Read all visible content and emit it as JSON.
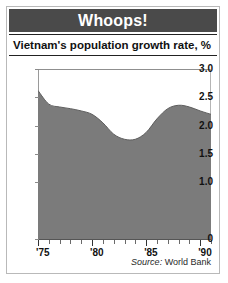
{
  "banner": {
    "title": "Whoops!"
  },
  "subtitle": "Vietnam's population growth rate, %",
  "source": {
    "lead": "Source:",
    "text": " World Bank"
  },
  "colors": {
    "banner_bg": "#4a4a4a",
    "banner_text": "#ffffff",
    "area_fill": "#7b7b7b",
    "area_line": "#5e5e5e",
    "axis": "#555555",
    "frame": "#b9b9b9"
  },
  "chart_data": {
    "type": "area",
    "title": "Whoops!",
    "subtitle": "Vietnam's population growth rate, %",
    "xlabel": "",
    "ylabel": "%",
    "xlim": [
      1975,
      1991
    ],
    "ylim": [
      0,
      3.0
    ],
    "grid": false,
    "legend": "none",
    "source": "Source: World Bank",
    "ytick_labels": [
      "3.0",
      "2.5",
      "2.0",
      "1.5",
      "1.0",
      "0"
    ],
    "ytick_values": [
      3.0,
      2.5,
      2.0,
      1.5,
      1.0,
      0
    ],
    "xtick_labels": [
      "'75",
      "'80",
      "'85",
      "'90"
    ],
    "xtick_values": [
      1975,
      1980,
      1985,
      1990
    ],
    "xtick_minor_step": 1,
    "x": [
      1975,
      1976,
      1977,
      1978,
      1979,
      1980,
      1981,
      1982,
      1983,
      1984,
      1985,
      1986,
      1987,
      1988,
      1989,
      1990,
      1991
    ],
    "values": [
      2.62,
      2.38,
      2.33,
      2.3,
      2.26,
      2.2,
      2.05,
      1.85,
      1.76,
      1.76,
      1.88,
      2.12,
      2.3,
      2.36,
      2.33,
      2.26,
      2.2
    ],
    "annotations": []
  }
}
